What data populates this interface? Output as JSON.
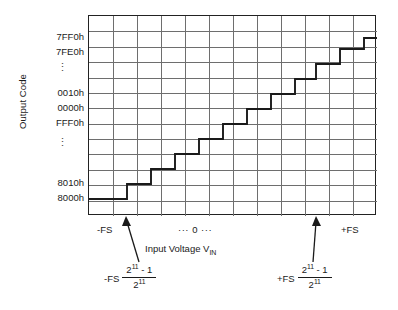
{
  "figure": {
    "background_color": "#ffffff",
    "line_color": "#222222",
    "grid_color": "#6e6e6e"
  },
  "axes": {
    "y_title": "Output Code",
    "x_title_prefix": "Input Voltage V",
    "x_title_sub": "IN",
    "y_labels": [
      "7FF0h",
      "7FE0h",
      "⋮",
      "0010h",
      "0000h",
      "FFF0h",
      "⋮",
      "8010h",
      "8000h"
    ],
    "x_labels": {
      "negative_full_scale": "-FS",
      "zero": "···  0  ···",
      "positive_full_scale": "+FS"
    },
    "grid_columns": 12,
    "grid_rows": 13
  },
  "annotations": {
    "left_formula": {
      "lead": "-FS",
      "numerator_base": "2",
      "numerator_exponent": "11",
      "numerator_suffix": " - 1",
      "denominator_base": "2",
      "denominator_exponent": "11"
    },
    "right_formula": {
      "lead": "+FS",
      "numerator_base": "2",
      "numerator_exponent": "11",
      "numerator_suffix": " - 1",
      "denominator_base": "2",
      "denominator_exponent": "11"
    }
  },
  "chart_data": {
    "type": "line",
    "xlabel": "Input Voltage VIN",
    "ylabel": "Output Code",
    "grid": true,
    "legend": null,
    "xlim": [
      0,
      288
    ],
    "ylim": [
      0,
      200
    ],
    "x_tick_labels": [
      "-FS",
      "··· 0 ···",
      "+FS"
    ],
    "y_tick_labels": [
      "8000h",
      "8010h",
      "⋮",
      "FFF0h",
      "0000h",
      "0010h",
      "⋮",
      "7FE0h",
      "7FF0h"
    ],
    "staircase_points_px": [
      [
        0,
        183
      ],
      [
        38,
        183
      ],
      [
        38,
        168
      ],
      [
        62,
        168
      ],
      [
        62,
        153
      ],
      [
        86,
        153
      ],
      [
        86,
        138
      ],
      [
        110,
        138
      ],
      [
        110,
        123
      ],
      [
        134,
        123
      ],
      [
        134,
        108
      ],
      [
        158,
        108
      ],
      [
        158,
        93
      ],
      [
        182,
        93
      ],
      [
        182,
        78
      ],
      [
        206,
        78
      ],
      [
        206,
        63
      ],
      [
        227,
        63
      ],
      [
        227,
        48
      ],
      [
        251,
        48
      ],
      [
        251,
        33
      ],
      [
        275,
        33
      ],
      [
        275,
        22
      ],
      [
        288,
        22
      ]
    ],
    "arrow_markers": [
      {
        "label": "-FS (2^11 - 1)/2^11",
        "x_px": 38
      },
      {
        "label": "+FS (2^11 - 1)/2^11",
        "x_px": 227
      }
    ]
  }
}
